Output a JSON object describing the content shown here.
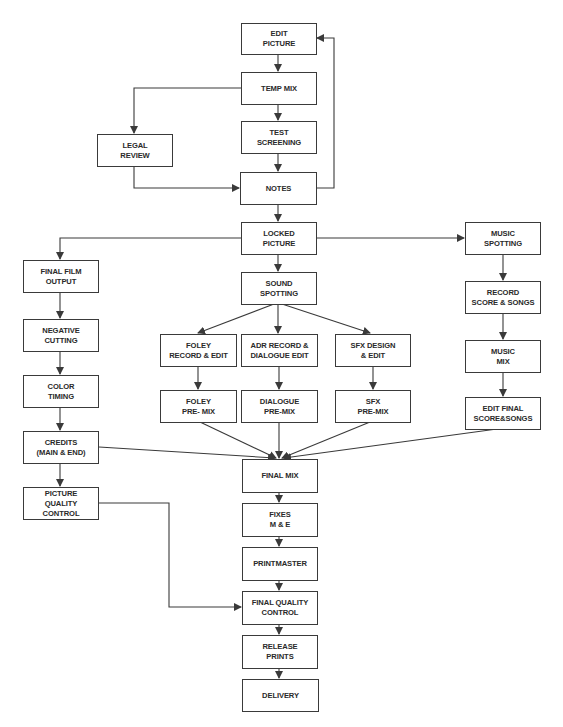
{
  "diagram": {
    "line_color": "#3a3a3a",
    "nodes": {
      "edit_picture": "EDIT\nPICTURE",
      "temp_mix": "TEMP MIX",
      "test_screening": "TEST\nSCREENING",
      "legal_review": "LEGAL\nREVIEW",
      "notes": "NOTES",
      "locked_picture": "LOCKED\nPICTURE",
      "final_film_output": "FINAL FILM\nOUTPUT",
      "negative_cutting": "NEGATIVE\nCUTTING",
      "color_timing": "COLOR\nTIMING",
      "credits": "CREDITS\n(MAIN & END)",
      "picture_quality_control": "PICTURE\nQUALITY\nCONTROL",
      "sound_spotting": "SOUND\nSPOTTING",
      "foley_record_edit": "FOLEY\nRECORD & EDIT",
      "adr_dialogue_edit": "ADR RECORD &\nDIALOGUE EDIT",
      "sfx_design_edit": "SFX DESIGN\n& EDIT",
      "foley_premix": "FOLEY\nPRE- MIX",
      "dialogue_premix": "DIALOGUE\nPRE-MIX",
      "sfx_premix": "SFX\nPRE-MIX",
      "music_spotting": "MUSIC\nSPOTTING",
      "record_score_songs": "RECORD\nSCORE & SONGS",
      "music_mix": "MUSIC\nMIX",
      "edit_final_score_songs": "EDIT FINAL\nSCORE&SONGS",
      "final_mix": "FINAL MIX",
      "fixes_me": "FIXES\nM & E",
      "printmaster": "PRINTMASTER",
      "final_quality_control": "FINAL QUALITY\nCONTROL",
      "release_prints": "RELEASE\nPRINTS",
      "delivery": "DELIVERY"
    },
    "edges": [
      [
        "edit_picture",
        "temp_mix"
      ],
      [
        "temp_mix",
        "test_screening"
      ],
      [
        "temp_mix",
        "legal_review"
      ],
      [
        "test_screening",
        "notes"
      ],
      [
        "legal_review",
        "notes"
      ],
      [
        "notes",
        "edit_picture"
      ],
      [
        "notes",
        "locked_picture"
      ],
      [
        "locked_picture",
        "final_film_output"
      ],
      [
        "locked_picture",
        "sound_spotting"
      ],
      [
        "locked_picture",
        "music_spotting"
      ],
      [
        "final_film_output",
        "negative_cutting"
      ],
      [
        "negative_cutting",
        "color_timing"
      ],
      [
        "color_timing",
        "credits"
      ],
      [
        "credits",
        "picture_quality_control"
      ],
      [
        "credits",
        "final_mix"
      ],
      [
        "sound_spotting",
        "foley_record_edit"
      ],
      [
        "sound_spotting",
        "adr_dialogue_edit"
      ],
      [
        "sound_spotting",
        "sfx_design_edit"
      ],
      [
        "foley_record_edit",
        "foley_premix"
      ],
      [
        "adr_dialogue_edit",
        "dialogue_premix"
      ],
      [
        "sfx_design_edit",
        "sfx_premix"
      ],
      [
        "foley_premix",
        "final_mix"
      ],
      [
        "dialogue_premix",
        "final_mix"
      ],
      [
        "sfx_premix",
        "final_mix"
      ],
      [
        "music_spotting",
        "record_score_songs"
      ],
      [
        "record_score_songs",
        "music_mix"
      ],
      [
        "music_mix",
        "edit_final_score_songs"
      ],
      [
        "edit_final_score_songs",
        "final_mix"
      ],
      [
        "final_mix",
        "fixes_me"
      ],
      [
        "fixes_me",
        "printmaster"
      ],
      [
        "printmaster",
        "final_quality_control"
      ],
      [
        "picture_quality_control",
        "final_quality_control"
      ],
      [
        "final_quality_control",
        "release_prints"
      ],
      [
        "release_prints",
        "delivery"
      ]
    ]
  }
}
